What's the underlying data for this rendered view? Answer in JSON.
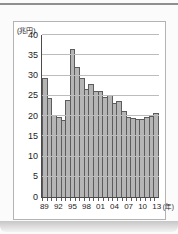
{
  "page": {
    "unit_label": "(兆円)",
    "year_suffix": "(年)"
  },
  "chart_data": {
    "type": "bar",
    "title": "",
    "xlabel": "(年)",
    "ylabel": "(兆円)",
    "ylim": [
      0,
      40
    ],
    "ytick_interval": 5,
    "yticks": [
      40,
      35,
      30,
      25,
      20,
      15,
      10,
      5,
      0
    ],
    "grid": true,
    "legend_position": "none",
    "bar_color": "#b5b5b5",
    "bar_border_color": "#5c5c5c",
    "x": [
      1989,
      1990,
      1991,
      1992,
      1993,
      1994,
      1995,
      1996,
      1997,
      1998,
      1999,
      2000,
      2001,
      2002,
      2003,
      2004,
      2005,
      2006,
      2007,
      2008,
      2009,
      2010,
      2011,
      2012,
      2013
    ],
    "values": [
      29.5,
      24.5,
      20.3,
      19.8,
      19.0,
      24.0,
      36.5,
      32.0,
      29.3,
      26.6,
      28.0,
      26.2,
      26.2,
      24.7,
      25.1,
      23.1,
      23.7,
      21.2,
      19.8,
      19.4,
      19.3,
      19.3,
      19.8,
      20.0,
      20.7
    ],
    "xtick_labels": [
      "89",
      "92",
      "95",
      "98",
      "01",
      "04",
      "07",
      "10",
      "13"
    ],
    "xtick_bar_indices": [
      0,
      3,
      6,
      9,
      12,
      15,
      18,
      21,
      24
    ]
  }
}
